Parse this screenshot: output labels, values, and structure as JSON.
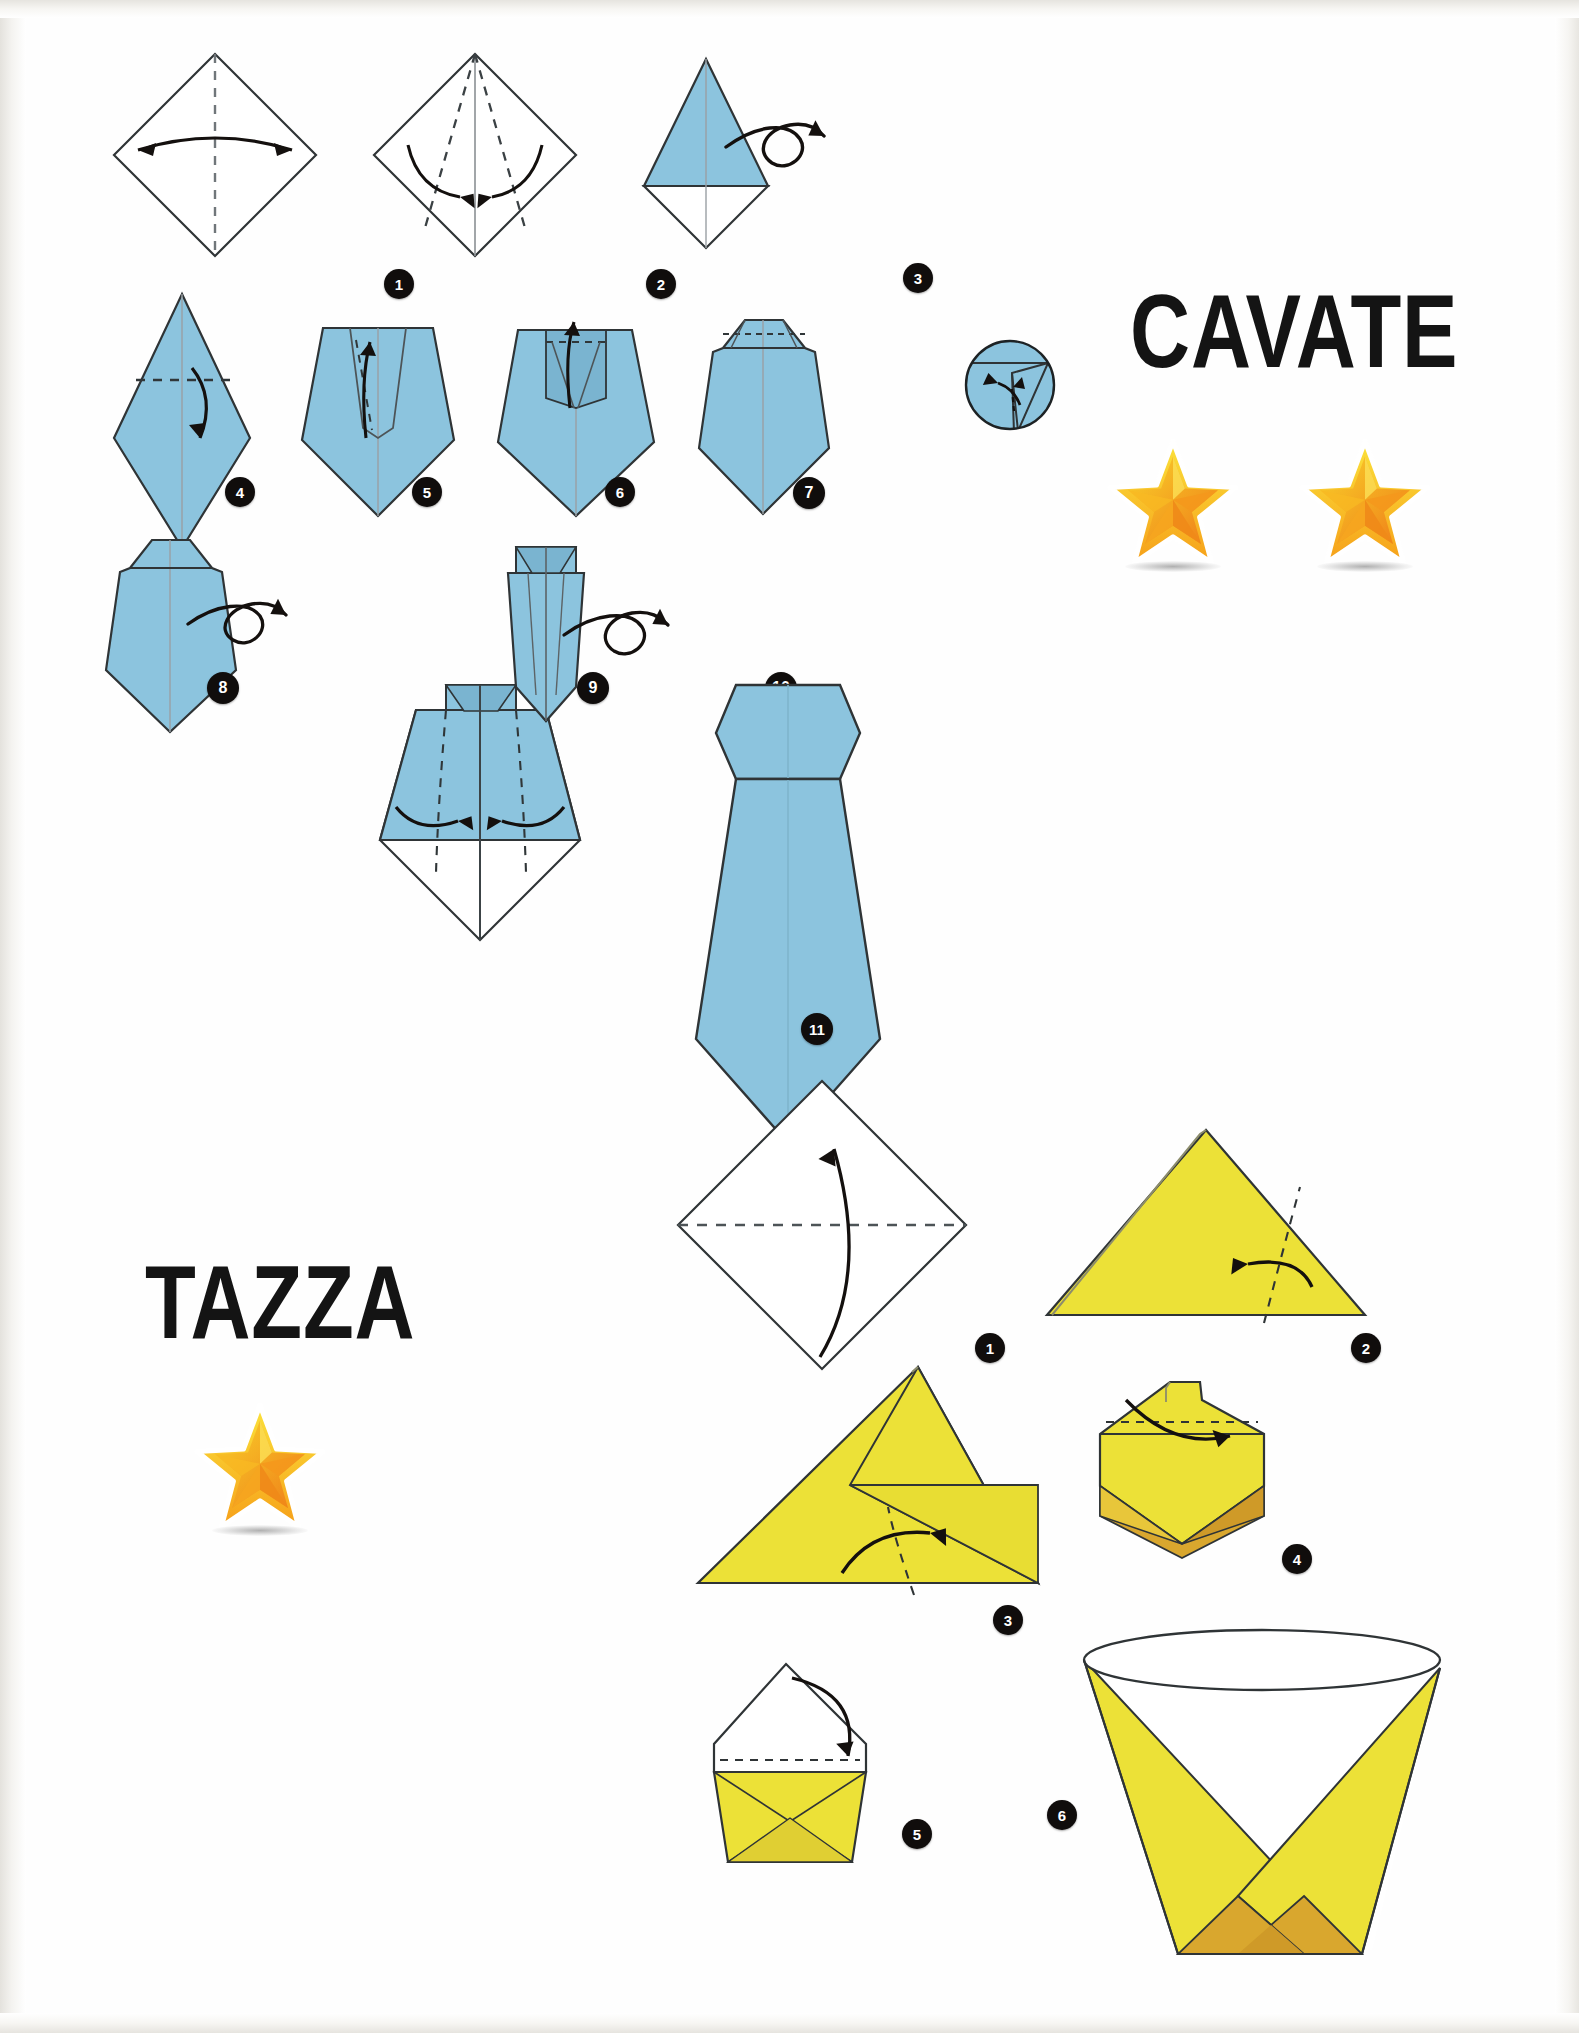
{
  "page": {
    "width": 1579,
    "height": 2033,
    "background": "#ffffff"
  },
  "palette": {
    "paper_blue": "#8cc4de",
    "paper_blue_shade": "#7ab4d0",
    "paper_yellow": "#ece137",
    "paper_yellow_dark": "#d9a72e",
    "paper_white": "#ffffff",
    "outline": "#2f3436",
    "badge_bg": "#100d0c",
    "badge_text": "#ffffff",
    "star_gold": "#f5c21c",
    "star_orange": "#f28c1c",
    "title_text": "#141414"
  },
  "models": [
    {
      "id": "cavate",
      "title": "CAVATE",
      "difficulty_stars": 2,
      "paper_color": "#8cc4de",
      "steps": [
        {
          "number": "1",
          "caption": "Valley-fold the square in half along the vertical diagonal and unfold."
        },
        {
          "number": "2",
          "caption": "Fold both upper edges in to the centre crease."
        },
        {
          "number": "3",
          "caption": "Turn the model over."
        },
        {
          "number": "4",
          "caption": "Fold the top point down."
        },
        {
          "number": "5",
          "caption": "Fold the small flap back up."
        },
        {
          "number": "6",
          "caption": "Fold the narrow band upward again."
        },
        {
          "number": "7",
          "caption": "Shape the collar, see the detail circle."
        },
        {
          "number": "8",
          "caption": "Turn the model over."
        },
        {
          "number": "9",
          "caption": "Fold both side edges in to the centre."
        },
        {
          "number": "10",
          "caption": "Turn the model over."
        },
        {
          "number": "11",
          "caption": "The finished necktie."
        }
      ]
    },
    {
      "id": "tazza",
      "title": "TAZZA",
      "difficulty_stars": 1,
      "paper_color": "#ece137",
      "steps": [
        {
          "number": "1",
          "caption": "Fold the square in half along the horizontal diagonal."
        },
        {
          "number": "2",
          "caption": "Fold the right point across to the left side."
        },
        {
          "number": "3",
          "caption": "Fold the left point across to the right side."
        },
        {
          "number": "4",
          "caption": "Fold the front top flap down."
        },
        {
          "number": "5",
          "caption": "Fold the back top flap down behind."
        },
        {
          "number": "6",
          "caption": "The finished cup."
        }
      ]
    }
  ],
  "star_count_labels": {
    "cavate": "2",
    "tazza": "1"
  }
}
